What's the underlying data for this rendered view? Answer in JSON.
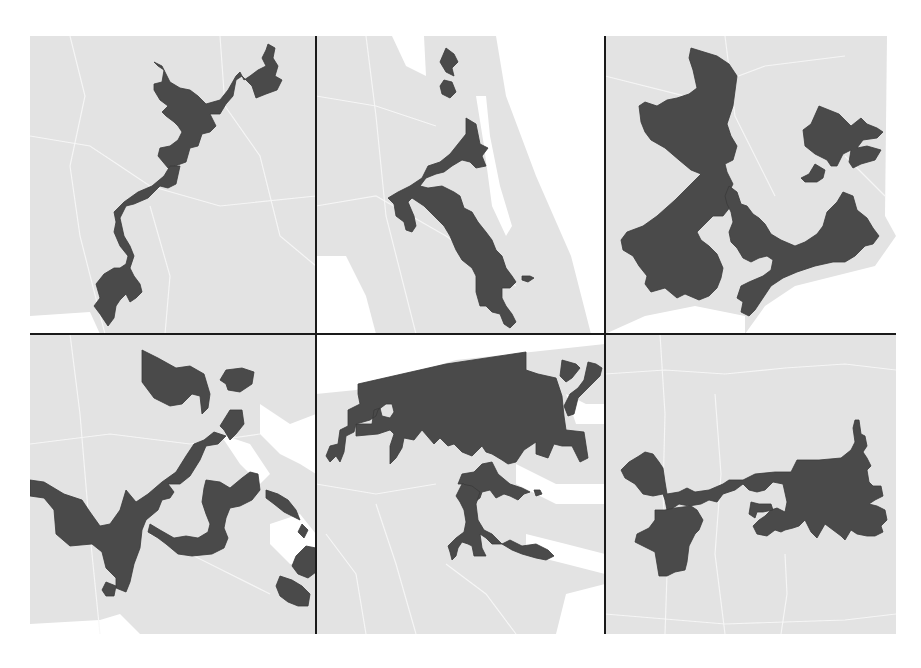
{
  "figure": {
    "layout": {
      "rows": 2,
      "cols": 3
    },
    "colors": {
      "district_fill": "#4a4a4a",
      "land_fill": "#e3e3e3",
      "water_fill": "#ffffff",
      "grid_line": "#1a1a1a",
      "county_borders": "#f7f7f7"
    },
    "panels": [
      {
        "id": "panel-1",
        "row": 1,
        "col": 1,
        "description": "Thin snaking district running from southwest to northeast"
      },
      {
        "id": "panel-2",
        "row": 1,
        "col": 2,
        "description": "Narrow district winding north-south along a corridor"
      },
      {
        "id": "panel-3",
        "row": 1,
        "col": 3,
        "description": "Large irregular district with coastal arc"
      },
      {
        "id": "panel-4",
        "row": 2,
        "col": 1,
        "description": "Fragmented district with multiple lobes connected by thin strips"
      },
      {
        "id": "panel-5",
        "row": 2,
        "col": 2,
        "description": "Wide northern block with branching southern arms"
      },
      {
        "id": "panel-6",
        "row": 2,
        "col": 3,
        "description": "Two large lobes joined by a long thin corridor"
      }
    ]
  }
}
